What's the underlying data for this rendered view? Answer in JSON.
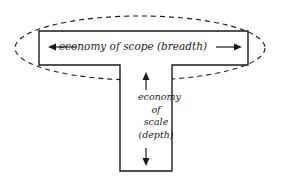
{
  "diagram": {
    "type": "T-shaped skills diagram",
    "horizontal_bar": {
      "label": "economy of scope (breadth)",
      "arrow_direction": "left-right",
      "enclosed_by": "dashed ellipse"
    },
    "vertical_bar": {
      "label_lines": [
        "economy",
        "of",
        "scale",
        "(depth)"
      ],
      "arrow_direction": "up-down"
    },
    "colors": {
      "stroke": "#1a1a1a",
      "background": "#ffffff"
    }
  }
}
